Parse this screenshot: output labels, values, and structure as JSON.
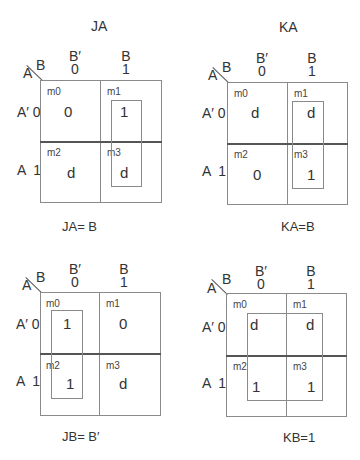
{
  "maps": [
    {
      "title": "JA",
      "col_var": "B",
      "row_var": "A",
      "col_headers": [
        {
          "lit": "B′",
          "bit": "0"
        },
        {
          "lit": "B",
          "bit": "1"
        }
      ],
      "row_headers": [
        "A′ 0",
        "A  1"
      ],
      "cells": [
        {
          "m": "m0",
          "v": "0"
        },
        {
          "m": "m1",
          "v": "1"
        },
        {
          "m": "m2",
          "v": "d"
        },
        {
          "m": "m3",
          "v": "d"
        }
      ],
      "grouping": "m1+m3 (column B=1)",
      "equation": "JA= B"
    },
    {
      "title": "KA",
      "col_var": "B",
      "row_var": "A",
      "col_headers": [
        {
          "lit": "B′",
          "bit": "0"
        },
        {
          "lit": "B",
          "bit": "1"
        }
      ],
      "row_headers": [
        "A′ 0",
        "A  1"
      ],
      "cells": [
        {
          "m": "m0",
          "v": "d"
        },
        {
          "m": "m1",
          "v": "d"
        },
        {
          "m": "m2",
          "v": "0"
        },
        {
          "m": "m3",
          "v": "1"
        }
      ],
      "grouping": "m1+m3 (column B=1)",
      "equation": "KA=B"
    },
    {
      "title": "",
      "col_var": "B",
      "row_var": "A",
      "col_headers": [
        {
          "lit": "B′",
          "bit": "0"
        },
        {
          "lit": "B",
          "bit": "1"
        }
      ],
      "row_headers": [
        "A′ 0",
        "A  1"
      ],
      "cells": [
        {
          "m": "m0",
          "v": "1"
        },
        {
          "m": "m1",
          "v": "0"
        },
        {
          "m": "m2",
          "v": "1"
        },
        {
          "m": "m3",
          "v": "d"
        }
      ],
      "grouping": "m0+m2 (column B=0)",
      "equation": "JB= B′"
    },
    {
      "title": "",
      "col_var": "B",
      "row_var": "A",
      "col_headers": [
        {
          "lit": "B′",
          "bit": "0"
        },
        {
          "lit": "B",
          "bit": "1"
        }
      ],
      "row_headers": [
        "A′ 0",
        "A  1"
      ],
      "cells": [
        {
          "m": "m0",
          "v": "d"
        },
        {
          "m": "m1",
          "v": "d"
        },
        {
          "m": "m2",
          "v": "1"
        },
        {
          "m": "m3",
          "v": "1"
        }
      ],
      "grouping": "m0+m1+m2+m3 (all cells)",
      "equation": "KB=1"
    }
  ]
}
